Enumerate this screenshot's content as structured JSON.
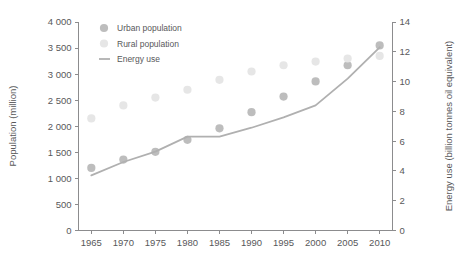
{
  "chart_data": {
    "type": "scatter",
    "title": "",
    "xlabel": "",
    "ylabel": "Population (million)",
    "y2label": "Energy use (billion tonnes oil equivalent)",
    "x": [
      1965,
      1970,
      1975,
      1980,
      1985,
      1990,
      1995,
      2000,
      2005,
      2010
    ],
    "xlim": [
      1963,
      2012
    ],
    "xticks": [
      "1965",
      "1970",
      "1975",
      "1980",
      "1985",
      "1990",
      "1995",
      "2000",
      "2005",
      "2010"
    ],
    "ylim": [
      0,
      4000
    ],
    "yticks": [
      "0",
      "500",
      "1 000",
      "1 500",
      "2 000",
      "2 500",
      "3 000",
      "3 500",
      "4 000"
    ],
    "y2lim": [
      0,
      14
    ],
    "y2ticks": [
      "0",
      "2",
      "4",
      "6",
      "8",
      "10",
      "12",
      "14"
    ],
    "grid": false,
    "legend_position": "top-left-inside",
    "series": [
      {
        "name": "Urban population",
        "type": "scatter",
        "axis": "left",
        "color": "#bdbdbd",
        "marker": "circle",
        "values": [
          1200,
          1360,
          1510,
          1740,
          1960,
          2270,
          2570,
          2860,
          3170,
          3550
        ]
      },
      {
        "name": "Rural population",
        "type": "scatter",
        "axis": "left",
        "color": "#e6e6e6",
        "marker": "circle",
        "values": [
          2150,
          2400,
          2550,
          2700,
          2890,
          3050,
          3170,
          3240,
          3300,
          3350
        ]
      },
      {
        "name": "Energy use",
        "type": "line",
        "axis": "right",
        "color": "#b0b0b0",
        "values": [
          3.7,
          4.6,
          5.3,
          6.3,
          6.3,
          6.9,
          7.6,
          8.4,
          10.2,
          12.3
        ]
      }
    ]
  },
  "legend": {
    "items": [
      {
        "label": "Urban population",
        "marker": "circle",
        "color": "#bdbdbd"
      },
      {
        "label": "Rural population",
        "marker": "circle",
        "color": "#e6e6e6"
      },
      {
        "label": "Energy use",
        "marker": "line",
        "color": "#b0b0b0"
      }
    ]
  },
  "axes": {
    "left_title": "Population (million)",
    "right_title": "Energy use (billion tonnes oil equivalent)"
  }
}
